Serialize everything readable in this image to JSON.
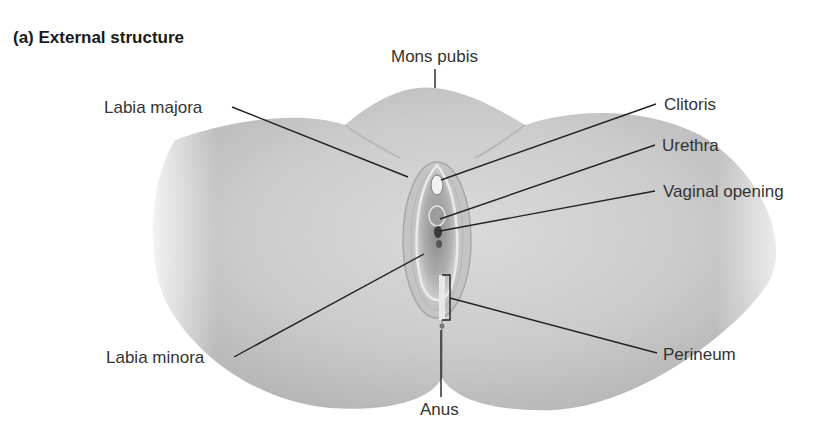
{
  "figure": {
    "title": "(a) External structure",
    "labels": {
      "mons_pubis": "Mons pubis",
      "labia_majora": "Labia majora",
      "clitoris": "Clitoris",
      "urethra": "Urethra",
      "vaginal_opening": "Vaginal opening",
      "labia_minora": "Labia minora",
      "perineum": "Perineum",
      "anus": "Anus"
    }
  },
  "colors": {
    "background": "#ffffff",
    "skin_light": "#e6e6e6",
    "skin_mid": "#c8c8c8",
    "skin_dark": "#9a9a9a",
    "leader_line": "#222222",
    "text": "#333333"
  }
}
